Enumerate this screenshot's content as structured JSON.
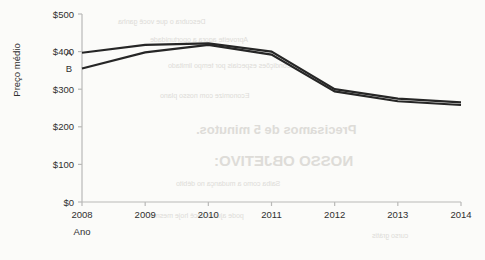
{
  "chart_data": {
    "type": "line",
    "title": "",
    "xlabel": "Ano",
    "ylabel": "Preço médio",
    "categories": [
      "2008",
      "2009",
      "2010",
      "2011",
      "2012",
      "2013",
      "2014"
    ],
    "x": [
      2008,
      2009,
      2010,
      2011,
      2012,
      2013,
      2014
    ],
    "series": [
      {
        "name": "A",
        "values": [
          397,
          418,
          422,
          400,
          300,
          275,
          265
        ]
      },
      {
        "name": "B",
        "values": [
          355,
          398,
          418,
          392,
          294,
          268,
          258
        ]
      }
    ],
    "ylim": [
      0,
      500
    ],
    "ytick_values": [
      0,
      100,
      200,
      300,
      400,
      500
    ],
    "ytick_labels": [
      "$0",
      "$100",
      "$200",
      "$300",
      "$400",
      "$500"
    ],
    "xlim": [
      2008,
      2014
    ],
    "grid": false,
    "legend_position": "inline-left",
    "series_color": "#262626",
    "axis_color": "#b9b9b7",
    "background_color": "#fbfbf9"
  },
  "background_artifacts": {
    "description": "faint mirrored bleed-through text from reverse of scanned page",
    "lines": [
      {
        "text": "Descubra o que você ganha",
        "x": 118,
        "y": 18,
        "size": 7,
        "weight": "400"
      },
      {
        "text": "Aproveite agora a oportunidade",
        "x": 150,
        "y": 36,
        "size": 7,
        "weight": "400"
      },
      {
        "text": "Condições especiais por tempo limitado",
        "x": 168,
        "y": 62,
        "size": 7,
        "weight": "400"
      },
      {
        "text": "Economize com nosso plano",
        "x": 160,
        "y": 92,
        "size": 7,
        "weight": "400"
      },
      {
        "text": "Precisamos de 5 minutos.",
        "x": 196,
        "y": 122,
        "size": 13,
        "weight": "700"
      },
      {
        "text": "NOSSO OBJETIVO:",
        "x": 214,
        "y": 152,
        "size": 15,
        "weight": "700"
      },
      {
        "text": "Saiba como a mudança no débito",
        "x": 176,
        "y": 180,
        "size": 7,
        "weight": "400"
      },
      {
        "text": "pode ajudar você hoje mesmo",
        "x": 150,
        "y": 212,
        "size": 7,
        "weight": "400"
      },
      {
        "text": "curso grátis",
        "x": 372,
        "y": 232,
        "size": 7,
        "weight": "400"
      }
    ]
  }
}
